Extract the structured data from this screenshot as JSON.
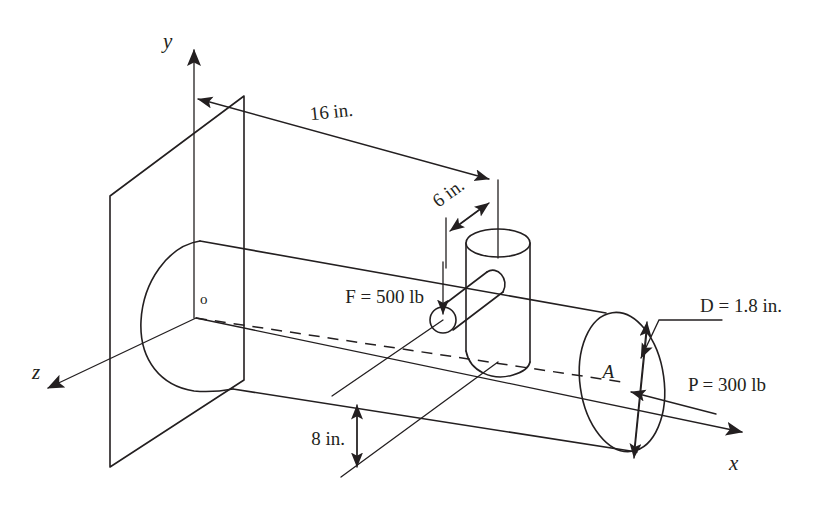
{
  "figure": {
    "type": "engineering-mechanics-free-body-diagram"
  },
  "axes": {
    "y": {
      "label": "y",
      "direction": "up"
    },
    "x": {
      "label": "x",
      "direction": "right-down"
    },
    "z": {
      "label": "z",
      "direction": "left-down"
    },
    "origin": {
      "label": "o"
    }
  },
  "dimensions": [
    {
      "id": "length-16",
      "label": "16 in.",
      "value": 16,
      "unit": "in.",
      "kind": "linear",
      "between": "y-axis to boss centerline"
    },
    {
      "id": "offset-6",
      "label": "6 in.",
      "value": 6,
      "unit": "in.",
      "kind": "linear",
      "between": "boss near face to boss centerline"
    },
    {
      "id": "height-8",
      "label": "8 in.",
      "value": 8,
      "unit": "in.",
      "kind": "linear",
      "between": "shaft axis to handle end"
    },
    {
      "id": "diameter-D",
      "label": "D = 1.8 in.",
      "value": 1.8,
      "unit": "in.",
      "kind": "diameter",
      "symbol": "D"
    }
  ],
  "loads": [
    {
      "id": "force-F",
      "label": "F = 500 lb",
      "symbol": "F",
      "value": 500,
      "unit": "lb",
      "direction": "downward",
      "applied_at": "end of lever handle"
    },
    {
      "id": "force-P",
      "label": "P = 300 lb",
      "symbol": "P",
      "value": 300,
      "unit": "lb",
      "direction": "axial, toward the wall",
      "applied_at": "point A"
    }
  ],
  "points": [
    {
      "id": "point-A",
      "label": "A",
      "description": "center of the free end cross-section of the shaft"
    },
    {
      "id": "point-o",
      "label": "o",
      "description": "origin at the wall end of the shaft axis"
    }
  ],
  "colors": {
    "ink": "#231f20",
    "paper": "#ffffff"
  }
}
